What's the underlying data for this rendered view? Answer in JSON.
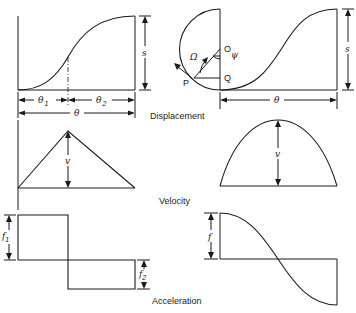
{
  "captions": {
    "displacement": "Displacement",
    "velocity": "Velocity",
    "acceleration": "Acceleration"
  },
  "symbols": {
    "s": "s",
    "theta": "θ",
    "theta1_base": "θ",
    "theta1_sub": "1",
    "theta2_base": "θ",
    "theta2_sub": "2",
    "v": "v",
    "f": "f",
    "f1_base": "f",
    "f1_sub": "1",
    "f2_base": "f",
    "f2_sub": "2",
    "omega": "Ω",
    "psi": "ψ",
    "point_O": "O",
    "point_Q": "Q",
    "point_P": "P"
  },
  "panels": {
    "left_column": "constant acceleration (parabolic) motion",
    "right_column": "simple harmonic motion"
  }
}
